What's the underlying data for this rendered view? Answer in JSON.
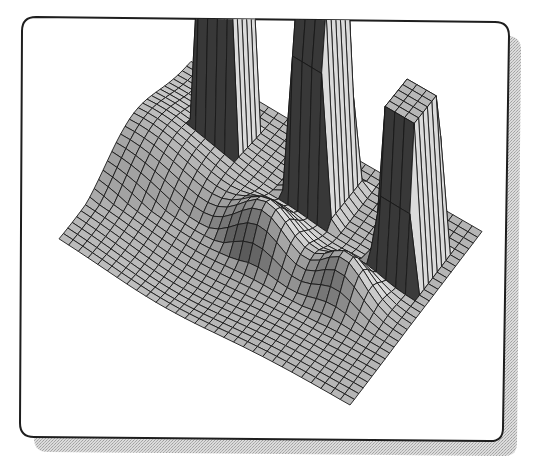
{
  "figure": {
    "frame": {
      "stroke_color": "#1e1e1e",
      "fill_color": "#ffffff",
      "shadow_color": "#c4c4c4",
      "corner_radius": 14
    },
    "colors": {
      "mesh_line": "#1a1a1a",
      "face_light": "#d2d2d2",
      "face_mid": "#a9a9a9",
      "face_dark": "#5a5a5a",
      "background": "#ffffff"
    }
  },
  "chart_data": {
    "type": "surface",
    "title": "",
    "xlabel": "",
    "ylabel": "",
    "zlabel": "",
    "axes_visible": false,
    "grid": "mesh",
    "legend": null,
    "mesh_resolution": [
      30,
      30
    ],
    "surface_features": [
      {
        "name": "plateau-1",
        "kind": "plateau",
        "x": 0.22,
        "y": 0.78,
        "width": 0.1,
        "depth": 0.16,
        "height": 1.0
      },
      {
        "name": "plateau-2",
        "kind": "plateau",
        "x": 0.55,
        "y": 0.78,
        "width": 0.12,
        "depth": 0.2,
        "height": 0.92
      },
      {
        "name": "plateau-3",
        "kind": "plateau",
        "x": 0.88,
        "y": 0.72,
        "width": 0.12,
        "depth": 0.2,
        "height": 0.72
      },
      {
        "name": "ridge-center",
        "kind": "bump",
        "x": 0.5,
        "y": 0.45,
        "sigma": 0.09,
        "height": 0.2
      },
      {
        "name": "ridge-right",
        "kind": "bump",
        "x": 0.78,
        "y": 0.45,
        "sigma": 0.07,
        "height": 0.16
      },
      {
        "name": "valley-front",
        "kind": "bump",
        "x": 0.35,
        "y": 0.15,
        "sigma": 0.2,
        "height": -0.18
      },
      {
        "name": "left-rise",
        "kind": "bump",
        "x": 0.05,
        "y": 0.55,
        "sigma": 0.2,
        "height": 0.12
      }
    ],
    "projection": {
      "origin_front": [
        350,
        405
      ],
      "x_axis_vector": [
        -9.7,
        -5.6
      ],
      "y_axis_vector": [
        4.4,
        -5.4
      ],
      "z_scale": 230
    }
  }
}
